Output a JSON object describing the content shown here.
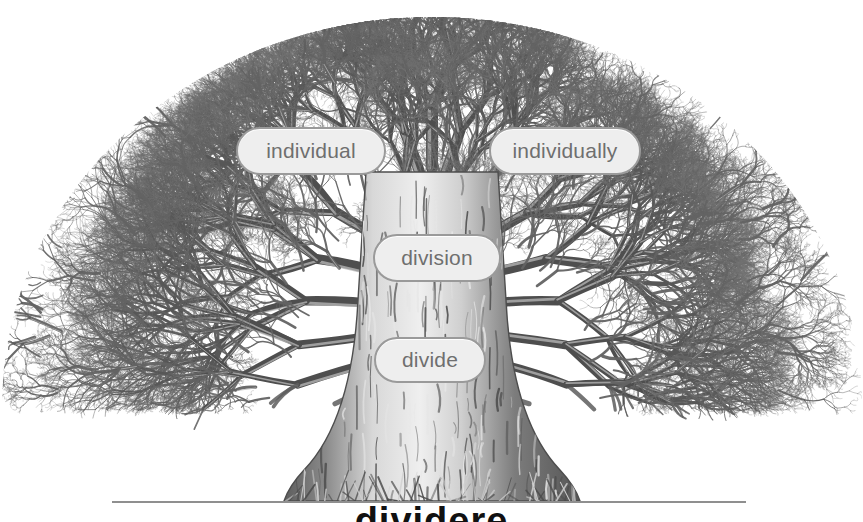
{
  "figure": {
    "kind": "word-family-tree",
    "background_color": "#ffffff",
    "ink_color": "#6b6b6b",
    "dark_ink_color": "#4a4a4a",
    "canopy": {
      "center_x": 432,
      "base_y": 405,
      "radius_x": 432,
      "radius_y": 390
    },
    "trunk": {
      "center_x": 432,
      "top_y": 170,
      "base_y": 502,
      "base_half_width": 66,
      "neck_half_width": 26
    },
    "ground_line": {
      "x_start": 112,
      "x_end": 746,
      "y": 501,
      "color": "#8f8f8f",
      "thickness": 2
    }
  },
  "labels": {
    "pill_fill": "#eeeeee",
    "pill_border": "#9a9a9a",
    "pill_text_color": "#6f6f6f",
    "items": [
      {
        "id": "individual",
        "text": "individual"
      },
      {
        "id": "individually",
        "text": "individually"
      },
      {
        "id": "division",
        "text": "division"
      },
      {
        "id": "divide",
        "text": "divide"
      }
    ]
  },
  "root_word": {
    "text": "dividere",
    "note": "cropped at bottom edge of the screenshot; only the tops of the letters are visible",
    "color": "#111111"
  }
}
